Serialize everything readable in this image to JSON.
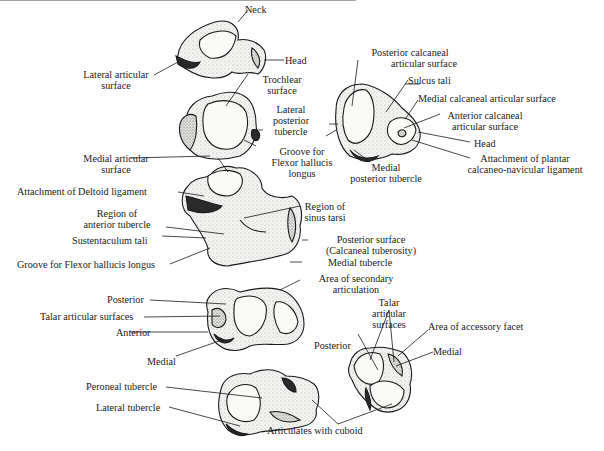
{
  "figure": {
    "colors": {
      "ink": "#1a1a1a",
      "bone_fill": "#f4f4f2",
      "shade": "#2a2a2a",
      "background": "#ffffff"
    }
  },
  "labels": {
    "neck": "Neck",
    "head_top": "Head",
    "lateral_articular_surface_1": "Lateral articular",
    "lateral_articular_surface_2": "surface",
    "posterior_calcaneal_1": "Posterior calcaneal",
    "posterior_calcaneal_2": "articular surface",
    "sulcus_tali": "Sulcus tali",
    "medial_calcaneal": "Medial calcaneal articular surface",
    "anterior_calcaneal_1": "Anterior calcaneal",
    "anterior_calcaneal_2": "articular surface",
    "head_right": "Head",
    "attachment_plantar_1": "Attachment of plantar",
    "attachment_plantar_2": "calcaneo-navicular ligament",
    "trochlear_1": "Trochlear",
    "trochlear_2": "surface",
    "lateral_posterior_1": "Lateral",
    "lateral_posterior_2": "posterior",
    "lateral_posterior_3": "tubercle",
    "groove_fhl_1": "Groove for",
    "groove_fhl_2": "Flexor hallucis",
    "groove_fhl_3": "longus",
    "medial_posterior_1": "Medial",
    "medial_posterior_2": "posterior tubercle",
    "medial_articular_1": "Medial articular",
    "medial_articular_2": "surface",
    "deltoid": "Attachment of Deltoid ligament",
    "region_anterior_1": "Region of",
    "region_anterior_2": "anterior tubercle",
    "sustentaculum": "Sustentaculum tali",
    "groove_fhl_long": "Groove for Flexor hallucis longus",
    "region_sinus_1": "Region of",
    "region_sinus_2": "sinus tarsi",
    "posterior_surface_1": "Posterior surface",
    "posterior_surface_2": "(Calcaneal tuberosity)",
    "medial_tubercle": "Medial tubercle",
    "secondary_articulation_1": "Area of secondary",
    "secondary_articulation_2": "articulation",
    "posterior_left": "Posterior",
    "talar_articular_surfaces": "Talar articular surfaces",
    "anterior_left": "Anterior",
    "medial_left": "Medial",
    "talar_right_1": "Talar",
    "talar_right_2": "articular",
    "talar_right_3": "surfaces",
    "accessory_facet": "Area of accessory facet",
    "posterior_right": "Posterior",
    "medial_right": "Medial",
    "peroneal_tubercle": "Peroneal tubercle",
    "lateral_tubercle": "Lateral tubercle",
    "articulates_cuboid": "Articulates with cuboid"
  }
}
